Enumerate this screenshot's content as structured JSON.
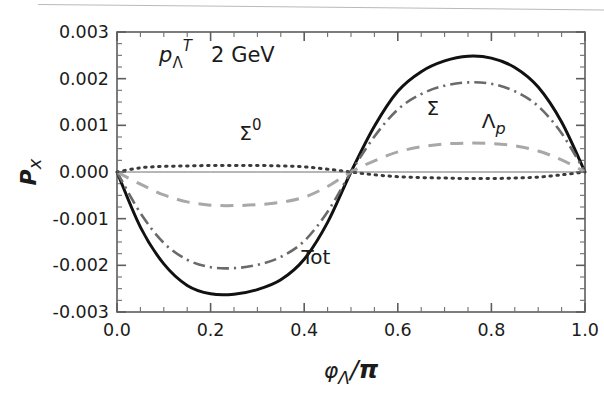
{
  "figure": {
    "kind": "scientific-plot",
    "background_color": "#ffffff",
    "scan_artifact_line_color": "#b9b9b9"
  },
  "chart_data": {
    "type": "line",
    "title": "",
    "subtitle": "",
    "xlabel": "φΛ/π",
    "ylabel": "Px",
    "xlim": [
      0.0,
      1.0
    ],
    "ylim": [
      -0.003,
      0.003
    ],
    "grid": false,
    "legend": "inline-curve-labels",
    "x_ticks": [
      "0.0",
      "0.2",
      "0.4",
      "0.6",
      "0.8",
      "1.0"
    ],
    "x_tick_values": [
      0.0,
      0.2,
      0.4,
      0.6,
      0.8,
      1.0
    ],
    "x_minor_tick_step": 0.05,
    "y_ticks": [
      "0.003",
      "0.002",
      "0.001",
      "0.000",
      "-0.001",
      "-0.002",
      "-0.003"
    ],
    "y_tick_values": [
      0.003,
      0.002,
      0.001,
      0.0,
      -0.001,
      -0.002,
      -0.003
    ],
    "y_minor_tick_step": 0.00025,
    "x": [
      0.0,
      0.05,
      0.1,
      0.15,
      0.2,
      0.25,
      0.3,
      0.35,
      0.4,
      0.45,
      0.5,
      0.55,
      0.6,
      0.65,
      0.7,
      0.75,
      0.8,
      0.85,
      0.9,
      0.95,
      1.0
    ],
    "series": [
      {
        "name": "Tot",
        "label": "Tot",
        "style": "solid",
        "color": "#111111",
        "width": 3.0,
        "min": -0.00262,
        "min_at_x": 0.25,
        "max": 0.00248,
        "max_at_x": 0.765,
        "values": [
          0.0,
          -0.00118,
          -0.00197,
          -0.00243,
          -0.00261,
          -0.00262,
          -0.00252,
          -0.00231,
          -0.00187,
          -0.00108,
          0.0,
          0.00098,
          0.00173,
          0.00215,
          0.00238,
          0.00248,
          0.00244,
          0.00224,
          0.00182,
          0.00107,
          0.0
        ]
      },
      {
        "name": "Sigma",
        "label": "Σ",
        "style": "dashdot",
        "color": "#6a6a6a",
        "width": 2.6,
        "min": -0.00206,
        "min_at_x": 0.255,
        "max": 0.00192,
        "max_at_x": 0.765,
        "values": [
          0.0,
          -0.00088,
          -0.00152,
          -0.00188,
          -0.00204,
          -0.00206,
          -0.00199,
          -0.00182,
          -0.00148,
          -0.00085,
          0.0,
          0.00076,
          0.00134,
          0.00167,
          0.00185,
          0.00192,
          0.00189,
          0.00173,
          0.00141,
          0.00083,
          0.0
        ]
      },
      {
        "name": "Lambda_p",
        "label": "Λp",
        "style": "dashed",
        "color": "#a8a8a8",
        "width": 3.0,
        "min": -0.00072,
        "min_at_x": 0.265,
        "max": 0.00062,
        "max_at_x": 0.765,
        "values": [
          0.0,
          -0.00026,
          -0.00049,
          -0.00064,
          -0.00071,
          -0.00072,
          -0.0007,
          -0.00065,
          -0.00054,
          -0.00031,
          0.0,
          0.00024,
          0.00043,
          0.00054,
          0.0006,
          0.00062,
          0.00061,
          0.00056,
          0.00045,
          0.00026,
          0.0
        ]
      },
      {
        "name": "Sigma0",
        "label": "Σ⁰",
        "style": "dotted",
        "color": "#3a3a3a",
        "width": 3.0,
        "min": -0.00014,
        "min_at_x": 0.76,
        "max": 0.00014,
        "max_at_x": 0.25,
        "values": [
          0.0,
          9e-05,
          0.00012,
          0.00013,
          0.00014,
          0.00014,
          0.00014,
          0.00013,
          0.00011,
          6e-05,
          0.0,
          -6e-05,
          -0.0001,
          -0.00012,
          -0.00013,
          -0.00014,
          -0.00014,
          -0.00013,
          -0.00011,
          -6e-05,
          0.0
        ]
      },
      {
        "name": "zero-baseline",
        "label": "",
        "style": "solid-thin",
        "color": "#6f6f6f",
        "width": 1.0,
        "values": [
          0,
          0,
          0,
          0,
          0,
          0,
          0,
          0,
          0,
          0,
          0,
          0,
          0,
          0,
          0,
          0,
          0,
          0,
          0,
          0,
          0
        ]
      }
    ],
    "annotations": [
      {
        "name": "momentum-annotation",
        "text_main": "p",
        "text_sub": "Λ",
        "text_sup": "T",
        "text_value": "2 GeV",
        "x": 0.09,
        "y": 0.00235
      },
      {
        "name": "label-sigma0",
        "text": "Σ",
        "sup": "0",
        "x": 0.285,
        "y": 0.00068
      },
      {
        "name": "label-sigma",
        "text": "Σ",
        "sup": "",
        "x": 0.675,
        "y": 0.00122
      },
      {
        "name": "label-lambda-p",
        "text": "Λ",
        "sub": "p",
        "x": 0.805,
        "y": 0.00095
      },
      {
        "name": "label-tot",
        "text": "Tot",
        "sup": "",
        "x": 0.425,
        "y": -0.00198
      }
    ]
  }
}
